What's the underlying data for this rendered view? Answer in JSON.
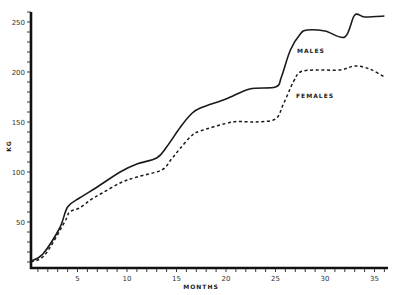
{
  "chart_data": {
    "type": "line",
    "title": "",
    "xlabel": "MONTHS",
    "ylabel": "KG",
    "xlim": [
      0,
      36.5
    ],
    "ylim": [
      0,
      260
    ],
    "grid": false,
    "legend": "inline labels next to curves",
    "x_ticks": [
      5,
      10,
      15,
      20,
      25,
      30,
      35
    ],
    "y_ticks": [
      50,
      100,
      150,
      200,
      250
    ],
    "series": [
      {
        "name": "MALES",
        "style": "solid",
        "x": [
          0.3,
          1.5,
          3.2,
          4.0,
          5.2,
          7.0,
          9.3,
          11.0,
          13.0,
          14.0,
          15.4,
          16.5,
          17.4,
          20.0,
          22.4,
          25.0,
          25.6,
          26.5,
          27.5,
          28.2,
          30.0,
          32.0,
          33.0,
          34.0,
          36.0
        ],
        "y": [
          11,
          18,
          44,
          65,
          74,
          85,
          100,
          108,
          114,
          125,
          145,
          158,
          164,
          173,
          183,
          185,
          195,
          222,
          238,
          242,
          241,
          235,
          257,
          255,
          256
        ]
      },
      {
        "name": "FEMALES",
        "style": "dashed",
        "x": [
          0.3,
          1.7,
          3.7,
          4.2,
          5.2,
          6.3,
          7.5,
          9.3,
          11.0,
          13.5,
          14.5,
          15.4,
          16.5,
          17.4,
          20.7,
          23.0,
          25.0,
          25.8,
          26.8,
          27.5,
          29.0,
          31.5,
          33.0,
          34.5,
          36.0
        ],
        "y": [
          10,
          17,
          50,
          60,
          64,
          72,
          79,
          89,
          95,
          102,
          113,
          124,
          136,
          141,
          150,
          150,
          153,
          168,
          190,
          200,
          202,
          202,
          206,
          203,
          195
        ]
      }
    ],
    "annotations": [
      {
        "text": "MALES",
        "near": "males curve around month 28"
      },
      {
        "text": "FEMALES",
        "near": "females curve around month 27"
      }
    ]
  }
}
